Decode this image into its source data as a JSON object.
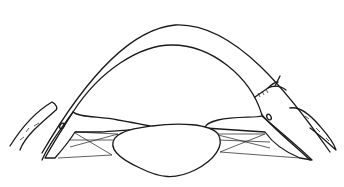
{
  "figure": {
    "title": "",
    "colors": {
      "ink": "#1a1a1a",
      "background": "#ffffff"
    },
    "parts": [
      "cornea",
      "anterior-chamber",
      "iris-left",
      "iris-right",
      "zonules-left",
      "zonules-right",
      "lens",
      "sutures",
      "conjunctiva-left",
      "conjunctiva-right"
    ]
  }
}
